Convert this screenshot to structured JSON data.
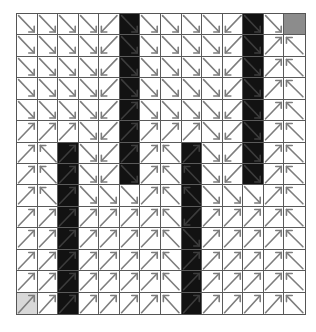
{
  "diagram": {
    "type": "gridworld-policy",
    "rows": 14,
    "cols": 14,
    "legend": {
      "SE": "arrow down-right",
      "SW": "arrow down-left",
      "NE": "arrow up-right",
      "NW": "arrow up-left",
      "W": "wall",
      "G": "goal"
    },
    "colors": {
      "empty": "#ffffff",
      "wall": "#121212",
      "goal": "#8c8c8c",
      "start": "#d8d8d8",
      "arrow": "#7d7d7d",
      "grid_line": "#5a5a5a"
    },
    "start": [
      13,
      0
    ],
    "goal": [
      0,
      13
    ],
    "cells": [
      [
        "SE",
        "SE",
        "SE",
        "SE",
        "SW",
        "W",
        "SE",
        "SE",
        "SE",
        "SE",
        "SW",
        "W",
        "SE",
        "G"
      ],
      [
        "SE",
        "SE",
        "SE",
        "SE",
        "SW",
        "W",
        "SE",
        "SE",
        "SE",
        "SE",
        "SW",
        "W",
        "NE",
        "NW"
      ],
      [
        "SE",
        "SE",
        "SE",
        "SE",
        "SW",
        "W",
        "SE",
        "SE",
        "SE",
        "SE",
        "SW",
        "W",
        "NE",
        "NW"
      ],
      [
        "SE",
        "SE",
        "SE",
        "SE",
        "SW",
        "W",
        "SE",
        "SE",
        "SE",
        "SE",
        "SW",
        "W",
        "NE",
        "NW"
      ],
      [
        "SE",
        "SE",
        "SE",
        "SE",
        "SW",
        "W",
        "SE",
        "SE",
        "SE",
        "SE",
        "SW",
        "W",
        "NE",
        "NW"
      ],
      [
        "NE",
        "NE",
        "NE",
        "SE",
        "SW",
        "W",
        "NE",
        "NE",
        "NE",
        "SE",
        "SW",
        "W",
        "NE",
        "NW"
      ],
      [
        "NE",
        "NW",
        "W",
        "SE",
        "SW",
        "W",
        "NE",
        "NW",
        "W",
        "SE",
        "SW",
        "W",
        "NE",
        "NW"
      ],
      [
        "NE",
        "NW",
        "W",
        "SE",
        "SW",
        "W",
        "NE",
        "NW",
        "W",
        "SE",
        "SW",
        "W",
        "NE",
        "NW"
      ],
      [
        "NE",
        "NW",
        "W",
        "SE",
        "SE",
        "SE",
        "NE",
        "NW",
        "W",
        "SE",
        "SE",
        "SE",
        "NE",
        "NW"
      ],
      [
        "NE",
        "NE",
        "W",
        "NE",
        "NE",
        "NE",
        "NE",
        "NW",
        "W",
        "NE",
        "NE",
        "NE",
        "NE",
        "NW"
      ],
      [
        "NE",
        "NE",
        "W",
        "NE",
        "NE",
        "NE",
        "NE",
        "NW",
        "W",
        "NE",
        "NE",
        "NE",
        "NE",
        "NW"
      ],
      [
        "NE",
        "NE",
        "W",
        "NE",
        "NE",
        "NE",
        "NE",
        "NW",
        "W",
        "NE",
        "NE",
        "NE",
        "NE",
        "NW"
      ],
      [
        "NE",
        "NE",
        "W",
        "NE",
        "NE",
        "NE",
        "NE",
        "NW",
        "W",
        "NE",
        "NE",
        "NE",
        "NE",
        "NW"
      ],
      [
        "NE",
        "NE",
        "W",
        "NE",
        "NE",
        "NE",
        "NE",
        "NW",
        "W",
        "NE",
        "NE",
        "NE",
        "NE",
        "NW"
      ]
    ],
    "wall_arrows": [
      [
        "",
        "",
        "",
        "",
        "",
        "SE",
        "",
        "",
        "",
        "",
        "",
        "SE",
        "",
        ""
      ],
      [
        "",
        "",
        "",
        "",
        "",
        "SE",
        "",
        "",
        "",
        "",
        "",
        "SE",
        "",
        ""
      ],
      [
        "",
        "",
        "",
        "",
        "",
        "SE",
        "",
        "",
        "",
        "",
        "",
        "SE",
        "",
        ""
      ],
      [
        "",
        "",
        "",
        "",
        "",
        "SE",
        "",
        "",
        "",
        "",
        "",
        "SE",
        "",
        ""
      ],
      [
        "",
        "",
        "",
        "",
        "",
        "NE",
        "",
        "",
        "",
        "",
        "",
        "SE",
        "",
        ""
      ],
      [
        "",
        "",
        "",
        "",
        "",
        "NE",
        "",
        "",
        "",
        "",
        "",
        "SE",
        "",
        ""
      ],
      [
        "",
        "",
        "NE",
        "",
        "",
        "NE",
        "",
        "",
        "NE",
        "",
        "",
        "SE",
        "",
        ""
      ],
      [
        "",
        "",
        "NE",
        "",
        "",
        "SE",
        "",
        "",
        "NW",
        "",
        "",
        "SE",
        "",
        ""
      ],
      [
        "",
        "",
        "NE",
        "",
        "",
        "",
        "",
        "",
        "NW",
        "",
        "",
        "",
        "",
        ""
      ],
      [
        "",
        "",
        "NE",
        "",
        "",
        "",
        "",
        "",
        "SW",
        "",
        "",
        "",
        "",
        ""
      ],
      [
        "",
        "",
        "NE",
        "",
        "",
        "",
        "",
        "",
        "SE",
        "",
        "",
        "",
        "",
        ""
      ],
      [
        "",
        "",
        "NE",
        "",
        "",
        "",
        "",
        "",
        "NE",
        "",
        "",
        "",
        "",
        ""
      ],
      [
        "",
        "",
        "NE",
        "",
        "",
        "",
        "",
        "",
        "NE",
        "",
        "",
        "",
        "",
        ""
      ],
      [
        "",
        "",
        "NE",
        "",
        "",
        "",
        "",
        "",
        "NE",
        "",
        "",
        "",
        "",
        ""
      ]
    ]
  }
}
